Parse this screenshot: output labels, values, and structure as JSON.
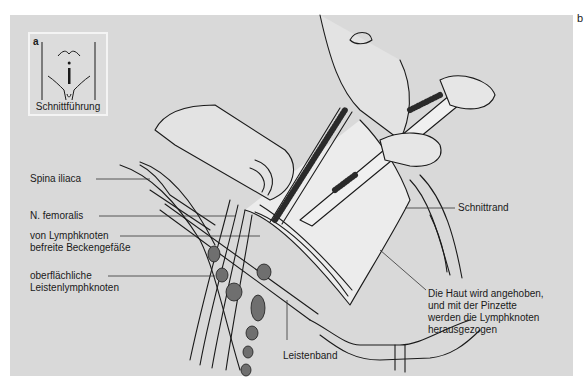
{
  "figure": {
    "panel_letter": "b",
    "inset": {
      "letter": "a",
      "caption": "Schnittführung"
    },
    "labels": {
      "spina_iliaca": "Spina iliaca",
      "n_femoralis": "N. femoralis",
      "beckengefaesse_line1": "von Lymphknoten",
      "beckengefaesse_line2": "befreite Beckengefäße",
      "lymphknoten_line1": "oberflächliche",
      "lymphknoten_line2": "Leistenlymphknoten",
      "leistenband": "Leistenband",
      "schnittrand": "Schnittrand",
      "haut_line1": "Die Haut wird angehoben,",
      "haut_line2": "und mit der Pinzette",
      "haut_line3": "werden die Lymphknoten",
      "haut_line4": "herausgezogen"
    },
    "colors": {
      "background": "#d9d9d9",
      "line": "#1a1a1a",
      "skin": "#e8e8e8",
      "node": "#6a6a6a"
    }
  }
}
